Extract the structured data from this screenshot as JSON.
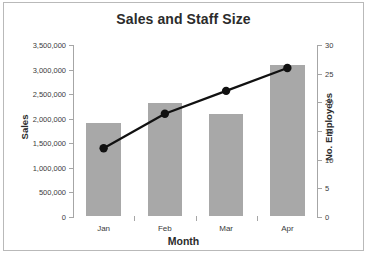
{
  "chart_data": {
    "type": "bar",
    "title": "Sales and Staff Size",
    "xlabel": "Month",
    "ylabel": "Sales",
    "y2label": "No. Employees",
    "categories": [
      "Jan",
      "Feb",
      "Mar",
      "Apr"
    ],
    "series": [
      {
        "name": "Sales Volume",
        "type": "bar",
        "axis": "left",
        "values": [
          1900000,
          2300000,
          2080000,
          3080000
        ]
      },
      {
        "name": "No. of Employees",
        "type": "line",
        "axis": "right",
        "values": [
          12,
          18,
          22,
          26
        ]
      }
    ],
    "ylim": [
      0,
      3500000
    ],
    "y2lim": [
      0,
      30
    ],
    "yticks": [
      0,
      500000,
      1000000,
      1500000,
      2000000,
      2500000,
      3000000,
      3500000
    ],
    "ytick_labels": [
      "0",
      "500,000",
      "1,000,000",
      "1,500,000",
      "2,000,000",
      "2,500,000",
      "3,000,000",
      "3,500,000"
    ],
    "y2ticks": [
      0,
      5,
      10,
      15,
      20,
      25,
      30
    ],
    "y2tick_labels": [
      "0",
      "5",
      "10",
      "15",
      "20",
      "25",
      "30"
    ],
    "grid": false,
    "legend_position": "upper-left-inside",
    "colors": {
      "bar": "#a8a8a8",
      "line": "#111111",
      "marker": "#111111",
      "axis": "#a6a6a6",
      "text": "#3b3b3b",
      "title": "#2b2b2b",
      "border": "#b9b9b9",
      "background": "#ffffff"
    }
  }
}
